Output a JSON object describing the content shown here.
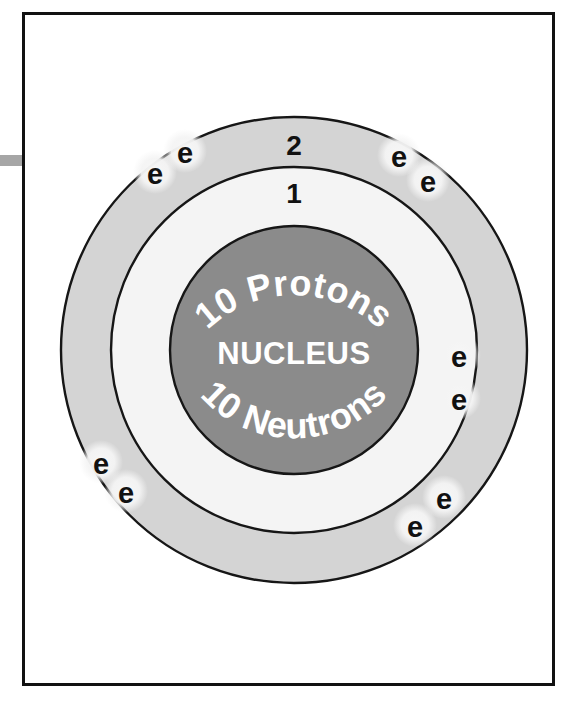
{
  "diagram": {
    "nucleus": {
      "protons_label": "10 Protons",
      "center_label": "NUCLEUS",
      "neutrons_label": "10 Neutrons"
    },
    "shells": [
      {
        "number": "1",
        "name": "inner-shell",
        "electron_count": 2
      },
      {
        "number": "2",
        "name": "outer-shell",
        "electron_count": 8
      }
    ],
    "electron_symbol": "e",
    "electrons": [
      {
        "id": "e1",
        "symbol": "e",
        "shell": "2",
        "cx": 155,
        "cy": 172
      },
      {
        "id": "e2",
        "symbol": "e",
        "shell": "2",
        "cx": 185,
        "cy": 151
      },
      {
        "id": "e3",
        "symbol": "e",
        "shell": "2",
        "cx": 399,
        "cy": 155
      },
      {
        "id": "e4",
        "symbol": "e",
        "shell": "2",
        "cx": 428,
        "cy": 180
      },
      {
        "id": "e5",
        "symbol": "e",
        "shell": "1",
        "cx": 459,
        "cy": 355
      },
      {
        "id": "e6",
        "symbol": "e",
        "shell": "1",
        "cx": 459,
        "cy": 398
      },
      {
        "id": "e7",
        "symbol": "e",
        "shell": "2",
        "cx": 101,
        "cy": 462
      },
      {
        "id": "e8",
        "symbol": "e",
        "shell": "2",
        "cx": 126,
        "cy": 491
      },
      {
        "id": "e9",
        "symbol": "e",
        "shell": "2",
        "cx": 444,
        "cy": 497
      },
      {
        "id": "e10",
        "symbol": "e",
        "shell": "2",
        "cx": 415,
        "cy": 525
      }
    ],
    "colors": {
      "outer_shell_fill": "#d4d4d4",
      "inner_shell_fill": "#f4f4f4",
      "nucleus_fill": "#8b8b8b",
      "outline": "#161616",
      "label_text": "#111111",
      "nucleus_text": "#ffffff",
      "electron_halo": "#f2f2f2",
      "frame_border": "#111111",
      "edge_tab": "#a6a6a6",
      "background": "#ffffff"
    },
    "geometry": {
      "center_x": 272,
      "center_y": 338,
      "outer_shell_radius": 233,
      "inner_shell_radius": 183,
      "nucleus_radius": 124
    }
  }
}
